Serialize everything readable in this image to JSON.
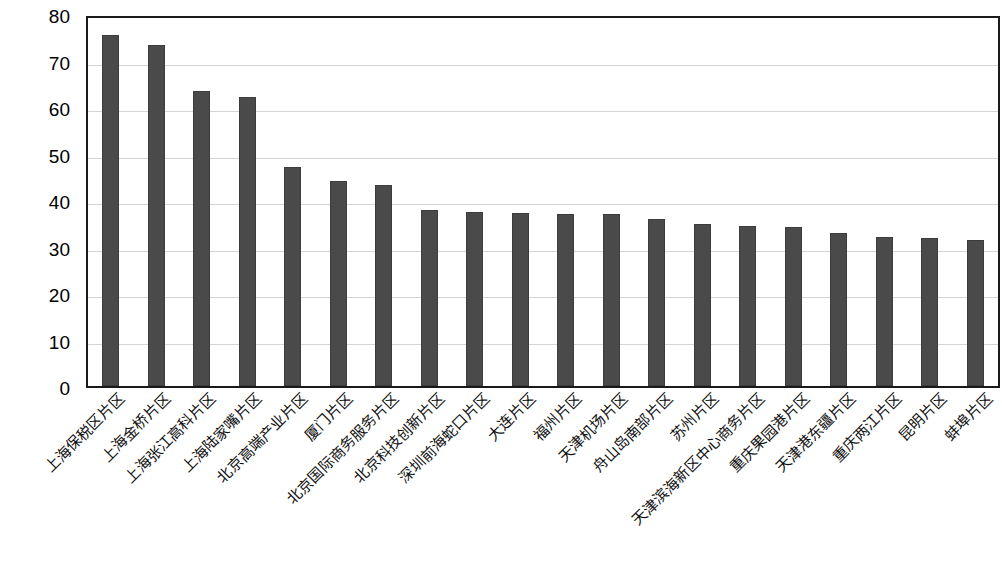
{
  "chart_data": {
    "type": "bar",
    "title": "",
    "subtitle": "",
    "xlabel": "",
    "ylabel": "",
    "ylim": [
      0,
      80
    ],
    "ytick_step": 10,
    "yticks": [
      80,
      70,
      60,
      50,
      40,
      30,
      20,
      10,
      0
    ],
    "grid": true,
    "legend": "none",
    "bar_color": "#4a4a4a",
    "axis_color": "#1a1a1a",
    "gridline_color": "#d4d4d4",
    "categories": [
      "上海保税区片区",
      "上海金桥片区",
      "上海张江高科片区",
      "上海陆家嘴片区",
      "北京高端产业片区",
      "厦门片区",
      "北京国际商务服务片区",
      "北京科技创新片区",
      "深圳前海蛇口片区",
      "大连片区",
      "福州片区",
      "天津机场片区",
      "舟山岛南部片区",
      "苏州片区",
      "天津滨海新区中心商务片区",
      "重庆果园港片区",
      "天津港东疆片区",
      "重庆两江片区",
      "昆明片区",
      "蚌埠片区"
    ],
    "values": [
      75.5,
      73.3,
      63.4,
      62.1,
      47.0,
      44.1,
      43.2,
      37.8,
      37.4,
      37.3,
      37.1,
      37.1,
      36.0,
      34.9,
      34.4,
      34.3,
      32.8,
      32.1,
      31.8,
      31.4
    ]
  }
}
